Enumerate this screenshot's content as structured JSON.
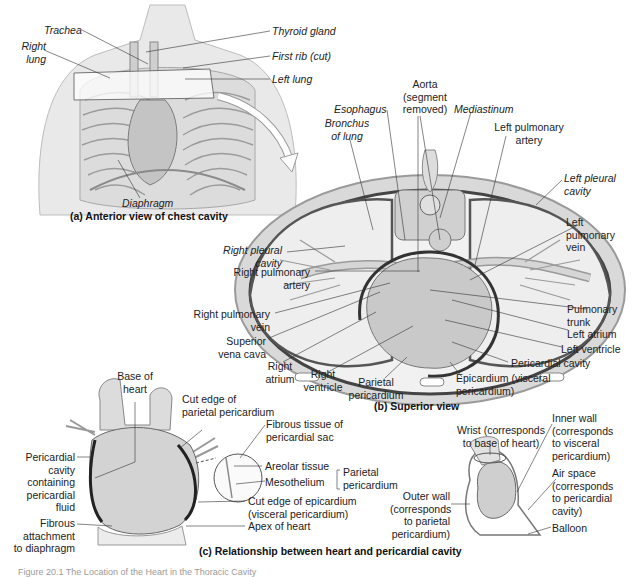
{
  "panel_a": {
    "caption": "(a) Anterior view of chest cavity",
    "labels": {
      "trachea": "Trachea",
      "right_lung": "Right\nlung",
      "thyroid_gland": "Thyroid gland",
      "first_rib": "First rib (cut)",
      "left_lung": "Left lung",
      "diaphragm": "Diaphragm"
    }
  },
  "panel_b": {
    "caption": "(b) Superior view",
    "labels": {
      "aorta": "Aorta\n(segment\nremoved)",
      "esophagus": "Esophagus",
      "mediastinum": "Mediastinum",
      "bronchus": "Bronchus\nof lung",
      "left_pulmonary_artery": "Left pulmonary\nartery",
      "left_pleural_cavity": "Left pleural\ncavity",
      "left_pulmonary_vein": "Left\npulmonary\nvein",
      "right_pleural_cavity": "Right pleural\ncavity",
      "right_pulmonary_artery": "Right pulmonary\nartery",
      "right_pulmonary_vein": "Right pulmonary\nvein",
      "superior_vena_cava": "Superior\nvena cava",
      "right_atrium": "Right\natrium",
      "right_ventricle": "Right\nventricle",
      "parietal_pericardium": "Parietal\npericardium",
      "pulmonary_trunk": "Pulmonary\ntrunk",
      "left_atrium": "Left atrium",
      "left_ventricle": "Left ventricle",
      "pericardial_cavity": "Pericardial cavity",
      "epicardium": "Epicardium (visceral\npericardium)"
    }
  },
  "panel_c": {
    "caption": "(c) Relationship between heart and pericardial cavity",
    "labels": {
      "base_of_heart": "Base of\nheart",
      "cut_edge_parietal": "Cut edge of\nparietal pericardium",
      "fibrous_tissue": "Fibrous tissue of\npericardial sac",
      "areolar_tissue": "Areolar tissue",
      "mesothelium": "Mesothelium",
      "parietal_pericardium": "Parietal\npericardium",
      "pericardial_cavity_fluid": "Pericardial\ncavity\ncontaining\npericardial\nfluid",
      "fibrous_attachment": "Fibrous\nattachment\nto diaphragm",
      "cut_edge_epicardium": "Cut edge of epicardium\n(visceral pericardium)",
      "apex_of_heart": "Apex of heart",
      "wrist": "Wrist (corresponds\nto base of heart)",
      "inner_wall": "Inner wall\n(corresponds\nto visceral\npericardium)",
      "air_space": "Air space\n(corresponds\nto pericardial\ncavity)",
      "outer_wall": "Outer wall\n(corresponds\nto parietal\npericardium)",
      "balloon": "Balloon"
    }
  },
  "figure_caption": "Figure 20.1 The Location of the Heart in the Thoracic Cavity"
}
